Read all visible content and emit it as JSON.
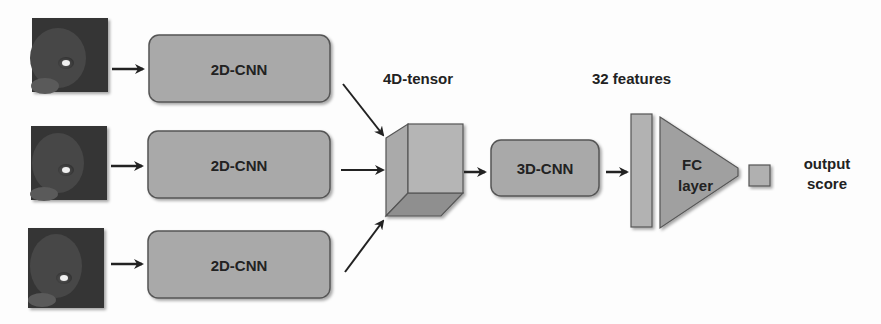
{
  "diagram": {
    "inputs": [
      {
        "label": "mri-slice-1"
      },
      {
        "label": "mri-slice-2"
      },
      {
        "label": "mri-slice-3"
      }
    ],
    "cnn2d": [
      {
        "label": "2D-CNN"
      },
      {
        "label": "2D-CNN"
      },
      {
        "label": "2D-CNN"
      }
    ],
    "tensor_label": "4D-tensor",
    "cnn3d_label": "3D-CNN",
    "features_label": "32 features",
    "fc_label_line1": "FC",
    "fc_label_line2": "layer",
    "output_line1": "output",
    "output_line2": "score",
    "colors": {
      "box_fill": "#a9a9a9",
      "box_stroke": "#555555",
      "cube_front": "#b4b4b4",
      "cube_side": "#9a9a9a",
      "cube_bottom": "#8e8e8e",
      "image_bg": "#3a3a3a",
      "arrow": "#222222"
    }
  }
}
